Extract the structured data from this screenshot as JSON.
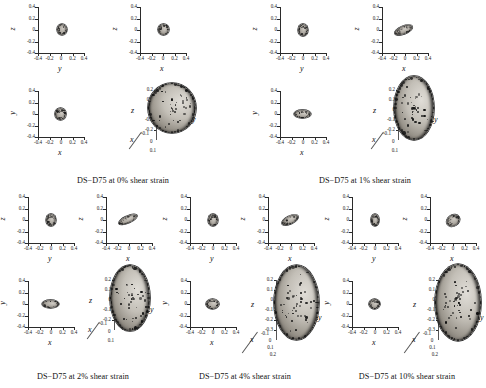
{
  "figure": {
    "specimen": "DS-D75"
  },
  "axis_names": {
    "x": "x",
    "y": "y",
    "z": "z"
  },
  "ticks_2d": {
    "y": [
      "0.4",
      "0.2",
      "0",
      "-0.2",
      "-0.4"
    ],
    "x": [
      "-0.4",
      "-0.2",
      "0",
      "0.2",
      "0.4"
    ]
  },
  "ticks_3d_small": {
    "z": [
      "0.2",
      "0.1",
      "0",
      "-0.1",
      "-0.2"
    ],
    "x": [
      "-0.1",
      "0",
      "0.1"
    ]
  },
  "ticks_3d_large": {
    "z": [
      "0.2",
      "0.1",
      "0",
      "-0.1",
      "-0.2",
      "-0.3"
    ],
    "x": [
      "-0.1",
      "0",
      "0.1",
      "0.2"
    ]
  },
  "groups": [
    {
      "id": "g0",
      "caption": "DS−D75 at 0% shear strain",
      "strain_percent": 0,
      "panels": [
        {
          "name": "z-vs-y",
          "xlabel": "y",
          "ylabel": "z",
          "blob": {
            "cx": 0.02,
            "cy": 0.01,
            "rx": 0.115,
            "ry": 0.125,
            "rot": 0
          }
        },
        {
          "name": "z-vs-x",
          "xlabel": "x",
          "ylabel": "z",
          "blob": {
            "cx": 0.01,
            "cy": 0.01,
            "rx": 0.12,
            "ry": 0.125,
            "rot": 0
          }
        },
        {
          "name": "y-vs-x",
          "xlabel": "x",
          "ylabel": "y",
          "blob": {
            "cx": -0.01,
            "cy": 0.0,
            "rx": 0.12,
            "ry": 0.12,
            "rot": 0
          }
        },
        {
          "name": "3d-view",
          "type": "3d",
          "scale": "small",
          "blob": {
            "rx": 0.175,
            "ry": 0.185,
            "rot": 0
          }
        }
      ]
    },
    {
      "id": "g1",
      "caption": "DS−D75 at 1% shear strain",
      "strain_percent": 1,
      "panels": [
        {
          "name": "z-vs-y",
          "xlabel": "y",
          "ylabel": "z",
          "blob": {
            "cx": 0.0,
            "cy": 0.0,
            "rx": 0.105,
            "ry": 0.135,
            "rot": 0
          }
        },
        {
          "name": "z-vs-x",
          "xlabel": "x",
          "ylabel": "z",
          "blob": {
            "cx": -0.03,
            "cy": 0.0,
            "rx": 0.21,
            "ry": 0.085,
            "rot": -22
          }
        },
        {
          "name": "y-vs-x",
          "xlabel": "x",
          "ylabel": "y",
          "blob": {
            "cx": -0.02,
            "cy": 0.0,
            "rx": 0.185,
            "ry": 0.095,
            "rot": 0
          }
        },
        {
          "name": "3d-view",
          "type": "3d",
          "scale": "small",
          "blob": {
            "rx": 0.145,
            "ry": 0.235,
            "rot": 0
          }
        }
      ]
    },
    {
      "id": "g2",
      "caption": "DS−D75 at 2% shear strain",
      "strain_percent": 2,
      "panels": [
        {
          "name": "z-vs-y",
          "xlabel": "y",
          "ylabel": "z",
          "blob": {
            "cx": 0.0,
            "cy": 0.0,
            "rx": 0.105,
            "ry": 0.135,
            "rot": 0
          }
        },
        {
          "name": "z-vs-x",
          "xlabel": "x",
          "ylabel": "z",
          "blob": {
            "cx": -0.02,
            "cy": 0.0,
            "rx": 0.215,
            "ry": 0.08,
            "rot": -24
          }
        },
        {
          "name": "y-vs-x",
          "xlabel": "x",
          "ylabel": "y",
          "blob": {
            "cx": -0.02,
            "cy": 0.0,
            "rx": 0.185,
            "ry": 0.09,
            "rot": 0
          }
        },
        {
          "name": "3d-view",
          "type": "3d",
          "scale": "small",
          "blob": {
            "rx": 0.145,
            "ry": 0.245,
            "rot": 0
          }
        }
      ]
    },
    {
      "id": "g3",
      "caption": "DS−D75 at 4% shear strain",
      "strain_percent": 4,
      "panels": [
        {
          "name": "z-vs-y",
          "xlabel": "y",
          "ylabel": "z",
          "blob": {
            "cx": 0.0,
            "cy": 0.0,
            "rx": 0.105,
            "ry": 0.13,
            "rot": 0
          }
        },
        {
          "name": "z-vs-x",
          "xlabel": "x",
          "ylabel": "z",
          "blob": {
            "cx": -0.03,
            "cy": 0.0,
            "rx": 0.195,
            "ry": 0.085,
            "rot": -26
          }
        },
        {
          "name": "y-vs-x",
          "xlabel": "x",
          "ylabel": "y",
          "blob": {
            "cx": -0.01,
            "cy": 0.0,
            "rx": 0.145,
            "ry": 0.105,
            "rot": 0
          }
        },
        {
          "name": "3d-view",
          "type": "3d",
          "scale": "large",
          "blob": {
            "rx": 0.15,
            "ry": 0.25,
            "rot": 0
          }
        }
      ]
    },
    {
      "id": "g4",
      "caption": "DS−D75 at 10% shear strain",
      "strain_percent": 10,
      "panels": [
        {
          "name": "z-vs-y",
          "xlabel": "y",
          "ylabel": "z",
          "blob": {
            "cx": 0.0,
            "cy": 0.0,
            "rx": 0.095,
            "ry": 0.125,
            "rot": 0
          }
        },
        {
          "name": "z-vs-x",
          "xlabel": "x",
          "ylabel": "z",
          "blob": {
            "cx": 0.0,
            "cy": 0.0,
            "rx": 0.155,
            "ry": 0.115,
            "rot": -32
          }
        },
        {
          "name": "y-vs-x",
          "xlabel": "x",
          "ylabel": "y",
          "blob": {
            "cx": -0.01,
            "cy": 0.0,
            "rx": 0.12,
            "ry": 0.105,
            "rot": 0
          }
        },
        {
          "name": "3d-view",
          "type": "3d",
          "scale": "large",
          "blob": {
            "rx": 0.155,
            "ry": 0.255,
            "rot": 0
          }
        }
      ]
    }
  ],
  "layout": {
    "group_origins": [
      {
        "id": "g0",
        "left": 4,
        "top": 2,
        "w": 238,
        "h": 186,
        "panels2d": 3,
        "caption_top": 174
      },
      {
        "id": "g1",
        "left": 246,
        "top": 2,
        "w": 238,
        "h": 186,
        "panels2d": 3,
        "caption_top": 174
      },
      {
        "id": "g2",
        "left": 4,
        "top": 192,
        "w": 158,
        "h": 194,
        "panels2d": 3,
        "caption_top": 180
      },
      {
        "id": "g3",
        "left": 166,
        "top": 192,
        "w": 158,
        "h": 194,
        "panels2d": 3,
        "caption_top": 180
      },
      {
        "id": "g4",
        "left": 328,
        "top": 192,
        "w": 158,
        "h": 194,
        "panels2d": 3,
        "caption_top": 180
      }
    ]
  },
  "colors": {
    "axis": "#2b2b2b",
    "text": "#1a1a1a",
    "blob_light": "#cfcbc4",
    "blob_mid": "#a8a39b",
    "blob_dark": "#3a3834",
    "speckle": "#1d1d1d",
    "background": "#ffffff"
  }
}
